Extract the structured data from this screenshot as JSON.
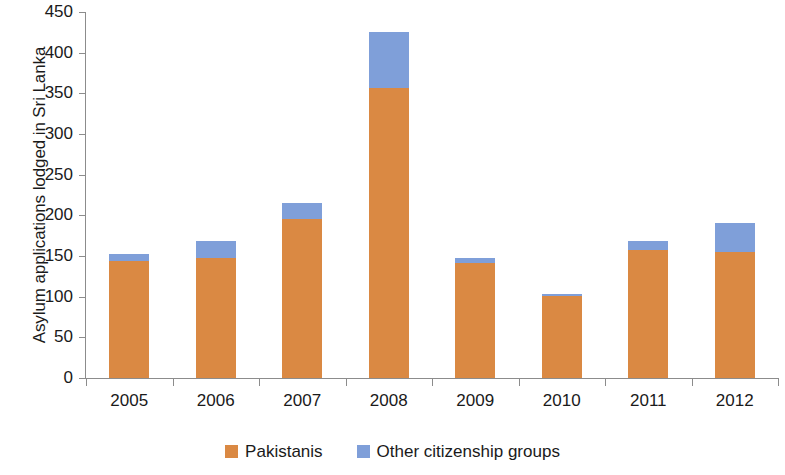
{
  "chart_data": {
    "type": "bar",
    "subtype": "stacked",
    "title": "",
    "xlabel": "",
    "ylabel": "Asylum applications  lodged in Sri Lanka",
    "categories": [
      "2005",
      "2006",
      "2007",
      "2008",
      "2009",
      "2010",
      "2011",
      "2012"
    ],
    "series": [
      {
        "name": "Pakistanis",
        "color": "#da8943",
        "values": [
          144,
          148,
          196,
          356,
          142,
          101,
          157,
          155
        ]
      },
      {
        "name": "Other citizenship groups",
        "color": "#7f9fd9",
        "values": [
          9,
          21,
          19,
          70,
          6,
          2,
          11,
          36
        ]
      }
    ],
    "totals": [
      153,
      169,
      215,
      426,
      148,
      103,
      168,
      191
    ],
    "ylim": [
      0,
      450
    ],
    "ytick_step": 50,
    "yticks": [
      "450",
      "400",
      "350",
      "300",
      "250",
      "200",
      "150",
      "100",
      "50",
      "0"
    ],
    "grid": false,
    "legend_position": "bottom"
  },
  "axis": {
    "y_title": "Asylum applications  lodged in Sri Lanka",
    "y_tick_labels": [
      "450",
      "400",
      "350",
      "300",
      "250",
      "200",
      "150",
      "100",
      "50",
      "0"
    ],
    "x_tick_labels": [
      "2005",
      "2006",
      "2007",
      "2008",
      "2009",
      "2010",
      "2011",
      "2012"
    ]
  },
  "legend": {
    "items": [
      {
        "label": "Pakistanis",
        "color": "#da8943"
      },
      {
        "label": "Other citizenship groups",
        "color": "#7f9fd9"
      }
    ]
  },
  "colors": {
    "pakistanis": "#da8943",
    "other_citizenship_groups": "#7f9fd9",
    "axis": "#8c8c8c",
    "text": "#1a1a1a",
    "background": "#ffffff"
  }
}
